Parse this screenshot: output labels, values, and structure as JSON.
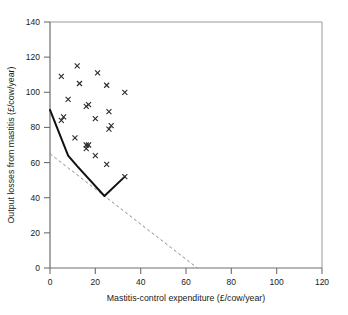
{
  "chart_data": {
    "type": "scatter",
    "title": "",
    "xlabel": "Mastitis-control expenditure (£/cow/year)",
    "ylabel": "Output losses from mastitis (£/cow/year)",
    "xlim": [
      0,
      120
    ],
    "ylim": [
      0,
      140
    ],
    "xticks": [
      0,
      20,
      40,
      60,
      80,
      100,
      120
    ],
    "yticks": [
      0,
      20,
      40,
      60,
      80,
      100,
      120,
      140
    ],
    "grid": false,
    "legend": "none",
    "marker": "x",
    "marker_color": "#2b2b2b",
    "series": [
      {
        "name": "Farm observations",
        "type": "scatter",
        "marker": "x",
        "color": "#2b2b2b",
        "points": [
          [
            5,
            109
          ],
          [
            12,
            115
          ],
          [
            21,
            111
          ],
          [
            13,
            105
          ],
          [
            25,
            104
          ],
          [
            33,
            100
          ],
          [
            8,
            96
          ],
          [
            16,
            92
          ],
          [
            17,
            93
          ],
          [
            26,
            89
          ],
          [
            20,
            85
          ],
          [
            5,
            84
          ],
          [
            6,
            86
          ],
          [
            27,
            81
          ],
          [
            26,
            79
          ],
          [
            11,
            74
          ],
          [
            16,
            70
          ],
          [
            17,
            70
          ],
          [
            16,
            68
          ],
          [
            20,
            64
          ],
          [
            25,
            59
          ],
          [
            33,
            52
          ]
        ]
      },
      {
        "name": "Fitted frontier",
        "type": "line",
        "style": "solid",
        "color": "#111111",
        "points": [
          [
            0,
            90
          ],
          [
            8,
            64
          ],
          [
            12,
            58
          ],
          [
            24,
            41
          ],
          [
            33,
            52
          ]
        ]
      },
      {
        "name": "Unit-slope reference line",
        "type": "line",
        "style": "dashed",
        "color": "#8c8c8c",
        "points": [
          [
            0,
            65
          ],
          [
            65,
            0
          ]
        ]
      }
    ]
  },
  "axes": {
    "x_title": "Mastitis-control expenditure (£/cow/year)",
    "y_title": "Output losses from mastitis (£/cow/year)",
    "x_tick_labels": [
      "0",
      "20",
      "40",
      "60",
      "80",
      "100",
      "120"
    ],
    "y_tick_labels": [
      "0",
      "20",
      "40",
      "60",
      "80",
      "100",
      "120",
      "140"
    ]
  },
  "colors": {
    "axis": "#6e6e6e",
    "frame": "#8a8a8a",
    "solid_line": "#111111",
    "dashed_line": "#8c8c8c",
    "marker": "#2b2b2b",
    "text": "#1a1a1a",
    "background": "#ffffff"
  }
}
